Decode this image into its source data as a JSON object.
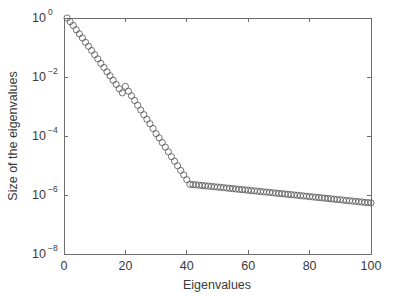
{
  "figure": {
    "background_color": "#ffffff",
    "axes_color": "#6e6e6e",
    "marker_color": "#5a5a5a"
  },
  "chart_data": {
    "type": "scatter",
    "title": "",
    "subtitle": "",
    "xlabel": "Eigenvalues",
    "ylabel": "Size of the eigenvalues",
    "xscale": "linear",
    "yscale": "log",
    "xlim": [
      0,
      100
    ],
    "ylim": [
      1e-08,
      1
    ],
    "xticks": [
      0,
      20,
      40,
      60,
      80,
      100
    ],
    "xticklabels": [
      "0",
      "20",
      "40",
      "60",
      "80",
      "100"
    ],
    "yticks": [
      1,
      0.01,
      0.0001,
      1e-06,
      1e-08
    ],
    "yticklabels": [
      "10^0",
      "10^-2",
      "10^-4",
      "10^-6",
      "10^-8"
    ],
    "ytick_mantissa": [
      "10",
      "10",
      "10",
      "10",
      "10"
    ],
    "ytick_exponents": [
      "0",
      "-2",
      "-4",
      "-6",
      "-8"
    ],
    "grid": false,
    "legend": null,
    "legend_position": "none",
    "marker": "circle-open",
    "marker_size": 3.1,
    "annotations": [],
    "series": [
      {
        "name": "eigenvalue spectrum",
        "x": [
          1,
          2,
          3,
          4,
          5,
          6,
          7,
          8,
          9,
          10,
          11,
          12,
          13,
          14,
          15,
          16,
          17,
          18,
          19,
          20,
          21,
          22,
          23,
          24,
          25,
          26,
          27,
          28,
          29,
          30,
          31,
          32,
          33,
          34,
          35,
          36,
          37,
          38,
          39,
          40,
          41,
          42,
          43,
          44,
          45,
          46,
          47,
          48,
          49,
          50,
          51,
          52,
          53,
          54,
          55,
          56,
          57,
          58,
          59,
          60,
          61,
          62,
          63,
          64,
          65,
          66,
          67,
          68,
          69,
          70,
          71,
          72,
          73,
          74,
          75,
          76,
          77,
          78,
          79,
          80,
          81,
          82,
          83,
          84,
          85,
          86,
          87,
          88,
          89,
          90,
          91,
          92,
          93,
          94,
          95,
          96,
          97,
          98,
          99,
          100
        ],
        "y": [
          1.0,
          0.75,
          0.56,
          0.4,
          0.29,
          0.21,
          0.15,
          0.11,
          0.079,
          0.057,
          0.041,
          0.029,
          0.021,
          0.015,
          0.011,
          0.0078,
          0.0056,
          0.004,
          0.0029,
          0.0048,
          0.0033,
          0.0023,
          0.0016,
          0.0011,
          0.00076,
          0.00053,
          0.00037,
          0.00026,
          0.00018,
          0.00012,
          8.6e-05,
          6e-05,
          4.2e-05,
          2.9e-05,
          2e-05,
          1.4e-05,
          9.8e-06,
          6.8e-06,
          4.8e-06,
          3.3e-06,
          2.3e-06,
          2.25e-06,
          2.2e-06,
          2.15e-06,
          2.1e-06,
          2.05e-06,
          2e-06,
          1.95e-06,
          1.9e-06,
          1.86e-06,
          1.81e-06,
          1.77e-06,
          1.72e-06,
          1.68e-06,
          1.64e-06,
          1.6e-06,
          1.56e-06,
          1.52e-06,
          1.49e-06,
          1.45e-06,
          1.41e-06,
          1.38e-06,
          1.35e-06,
          1.31e-06,
          1.28e-06,
          1.25e-06,
          1.22e-06,
          1.19e-06,
          1.16e-06,
          1.13e-06,
          1.11e-06,
          1.08e-06,
          1.05e-06,
          1.03e-06,
          1e-06,
          9.8e-07,
          9.5e-07,
          9.3e-07,
          9.1e-07,
          8.8e-07,
          8.6e-07,
          8.4e-07,
          8.2e-07,
          8e-07,
          7.8e-07,
          7.6e-07,
          7.4e-07,
          7.2e-07,
          7e-07,
          6.9e-07,
          6.7e-07,
          6.5e-07,
          6.4e-07,
          6.2e-07,
          6.1e-07,
          5.9e-07,
          5.8e-07,
          5.6e-07,
          5.5e-07,
          5.4e-07
        ]
      }
    ]
  }
}
